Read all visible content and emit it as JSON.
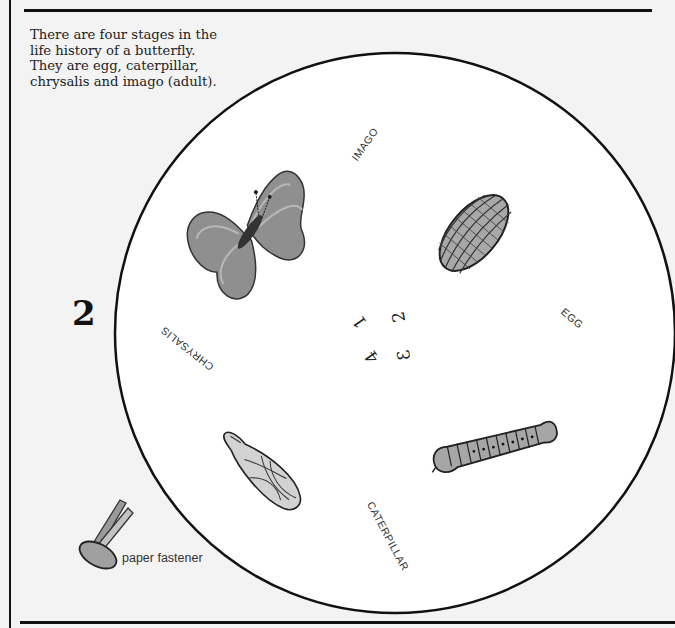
{
  "intro": {
    "lines": [
      "There are four stages in the",
      "life history of a butterfly.",
      "They are egg, caterpillar,",
      "chrysalis and imago (adult)."
    ]
  },
  "page_number": "2",
  "wheel": {
    "stages": [
      {
        "label": "IMAGO",
        "icon": "butterfly-icon",
        "number": "1"
      },
      {
        "label": "EGG",
        "icon": "egg-icon",
        "number": "2"
      },
      {
        "label": "CATERPILLAR",
        "icon": "caterpillar-icon",
        "number": "3"
      },
      {
        "label": "CHRYSALIS",
        "icon": "chrysalis-icon",
        "number": "4"
      }
    ],
    "numbers": [
      "1",
      "2",
      "3",
      "4"
    ]
  },
  "fastener": {
    "label": "paper fastener",
    "icon": "paper-fastener-icon"
  },
  "colors": {
    "background": "#f3f3f3",
    "wheel_fill": "#ffffff",
    "ink": "#111111",
    "illustration_gray": "#8a8a8a"
  }
}
